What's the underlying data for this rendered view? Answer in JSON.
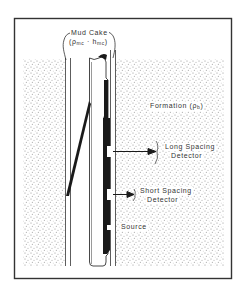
{
  "diagram": {
    "type": "density-logging-tool-schematic",
    "labels": {
      "mud_cake": "Mud Cake",
      "mud_cake_params": "(ρmc · hmc)",
      "mud_cake_rho": "ρ",
      "mud_cake_rho_sub": "mc",
      "mud_cake_sep": " · ",
      "mud_cake_h": "h",
      "mud_cake_h_sub": "mc",
      "formation": "Formation (ρb)",
      "formation_word": "Formation (",
      "formation_rho": "ρ",
      "formation_rho_sub": "b",
      "formation_close": ")",
      "long_spacing_line1": "Long Spacing",
      "long_spacing_line2": "Detector",
      "short_spacing_line1": "Short Spacing",
      "short_spacing_line2": "Detector",
      "source": "Source"
    },
    "colors": {
      "ink": "#1a1a1a",
      "frame": "#333333",
      "dots": "#8a8a8a",
      "background": "#ffffff"
    }
  }
}
